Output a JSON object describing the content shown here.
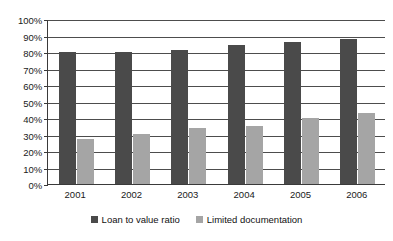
{
  "chart_data": {
    "type": "bar",
    "title": "",
    "xlabel": "",
    "ylabel": "",
    "categories": [
      "2001",
      "2002",
      "2003",
      "2004",
      "2005",
      "2006"
    ],
    "series": [
      {
        "name": "Loan to value ratio",
        "color": "#4a4a4a",
        "values": [
          80,
          80,
          81,
          84,
          86,
          88
        ]
      },
      {
        "name": "Limited documentation",
        "color": "#a5a5a5",
        "values": [
          27,
          30.5,
          34,
          35,
          40,
          43
        ]
      }
    ],
    "ylim": [
      0,
      100
    ],
    "ytick_step": 10,
    "ytick_labels": [
      "0%",
      "10%",
      "20%",
      "30%",
      "40%",
      "50%",
      "60%",
      "70%",
      "80%",
      "90%",
      "100%"
    ],
    "ytick_values": [
      0,
      10,
      20,
      30,
      40,
      50,
      60,
      70,
      80,
      90,
      100
    ],
    "grid": true,
    "legend_position": "bottom"
  }
}
